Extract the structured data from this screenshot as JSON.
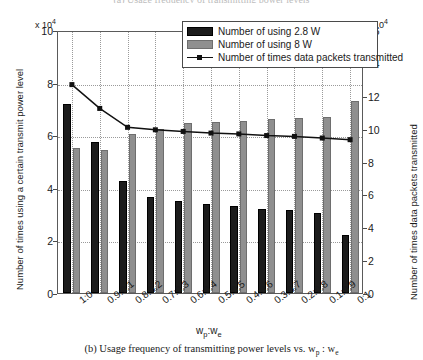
{
  "figure": {
    "top_caption_clipped": "(a) Usage frequency of transmitting power levels",
    "bottom_caption_prefix": "(b) Usage frequency of transmitting power levels vs. ",
    "bottom_caption_wp": "w",
    "bottom_caption_wp_sub": "p",
    "bottom_caption_sep": " : ",
    "bottom_caption_we": "w",
    "bottom_caption_we_sub": "e"
  },
  "legend": {
    "items": [
      {
        "label": "Number of using 2.8 W",
        "marker": "dark-swatch",
        "color": "#1c1c1c"
      },
      {
        "label": "Number of using 8 W",
        "marker": "gray-swatch",
        "color": "#8f8f8f"
      },
      {
        "label": "Number of times data packets transmitted",
        "marker": "line-square",
        "color": "#111111"
      }
    ]
  },
  "axes": {
    "left_exponent": "x 10",
    "left_exponent_sup": "4",
    "right_exponent": "x 10",
    "right_exponent_sup": "4",
    "left_title": "Number of times using a certain transmit power level",
    "right_title": "Number of times data packets transmitted",
    "x_title_w": "w",
    "x_title_p": "p",
    "x_title_colon": ":w",
    "x_title_e": "e",
    "left_ticks": [
      "0",
      "2",
      "4",
      "6",
      "8",
      "10"
    ],
    "right_ticks": [
      "0",
      "2",
      "4",
      "6",
      "8",
      "10",
      "12",
      "14",
      "16"
    ]
  },
  "chart_data": {
    "type": "bar",
    "title": "Usage frequency of transmitting power levels vs. wp : we",
    "xlabel": "w_p : w_e",
    "ylabel": "Number of times using a certain transmit power level",
    "y2label": "Number of times data packets transmitted",
    "ylim": [
      0,
      10
    ],
    "y2lim": [
      0,
      16
    ],
    "y_scale": "x 10^4",
    "y2_scale": "x 10^4",
    "grid": true,
    "legend_position": "top-right",
    "categories": [
      "1:0",
      "0.9:0.1",
      "0.8:0.2",
      "0.7:0.3",
      "0.6:0.4",
      "0.5:0.5",
      "0.4:0.6",
      "0.3:0.7",
      "0.2:0.8",
      "0.1:0.9",
      "0:1"
    ],
    "series": [
      {
        "name": "Number of using 2.8 W",
        "axis": "left",
        "type": "bar",
        "color": "#1c1c1c",
        "values": [
          7.2,
          5.75,
          4.25,
          3.65,
          3.5,
          3.4,
          3.3,
          3.2,
          3.15,
          3.05,
          2.2
        ]
      },
      {
        "name": "Number of using 8 W",
        "axis": "left",
        "type": "bar",
        "color": "#8f8f8f",
        "values": [
          5.5,
          5.45,
          6.05,
          6.25,
          6.45,
          6.5,
          6.55,
          6.6,
          6.65,
          6.7,
          7.3
        ]
      },
      {
        "name": "Number of times data packets transmitted",
        "axis": "right",
        "type": "line",
        "color": "#111111",
        "marker": "square",
        "values": [
          12.8,
          11.35,
          10.2,
          10.05,
          9.95,
          9.85,
          9.8,
          9.7,
          9.65,
          9.55,
          9.45
        ]
      }
    ]
  }
}
